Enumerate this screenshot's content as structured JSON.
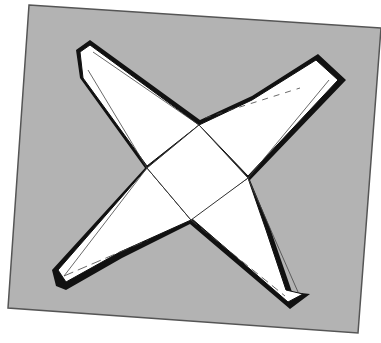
{
  "figure": {
    "colors": {
      "page_background": "#ffffff",
      "card": "#b3b3b3",
      "card_edge": "#555555",
      "paper": "#ffffff",
      "outline": "#111111",
      "fold_line": "#444444"
    },
    "card": {
      "points": "29,5 381,28 358,333 8,308"
    },
    "center_square": {
      "points": "199,125 248,178 191,220 147,168"
    },
    "arms": [
      {
        "name": "north-west",
        "points": "147,168 80,75 78,50 90,42 199,125"
      },
      {
        "name": "north-east",
        "points": "199,125 250,98 316,57 342,80 248,178"
      },
      {
        "name": "south-east",
        "points": "248,178 268,230 290,295 307,296 288,306 191,220"
      },
      {
        "name": "south-west",
        "points": "191,220 120,255 65,285 55,270 147,168"
      }
    ]
  }
}
